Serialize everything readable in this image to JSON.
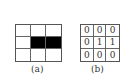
{
  "figure_a": {
    "caption": "(a)",
    "rows": 3,
    "cols": 3,
    "cells": [
      [
        0,
        0,
        0
      ],
      [
        0,
        1,
        1
      ],
      [
        0,
        0,
        0
      ]
    ],
    "fill_color": "#000000"
  },
  "figure_b": {
    "caption": "(b)",
    "values": [
      [
        "0",
        "0",
        "0"
      ],
      [
        "0",
        "1",
        "1"
      ],
      [
        "0",
        "0",
        "0"
      ]
    ]
  }
}
